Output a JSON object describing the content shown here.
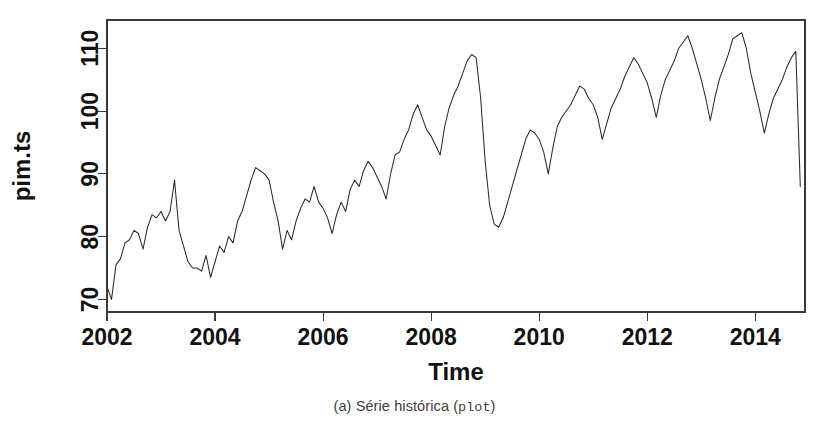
{
  "figure": {
    "caption_prefix": "(a) Série histórica (",
    "caption_code": "plot",
    "caption_suffix": ")",
    "caption_full": "(a) Série histórica (plot)",
    "line_color": "#2b2b2b",
    "axis_color": "#3a3a3a",
    "background_color": "#ffffff"
  },
  "chart_data": {
    "type": "line",
    "title": "",
    "subtitle": "",
    "xlabel": "Time",
    "ylabel": "pim.ts",
    "xlim": [
      2002.0,
      2014.92
    ],
    "ylim": [
      68.0,
      114.5
    ],
    "xticks": [
      2002,
      2004,
      2006,
      2008,
      2010,
      2012,
      2014
    ],
    "xtick_labels": [
      "2002",
      "2004",
      "2006",
      "2008",
      "2010",
      "2012",
      "2014"
    ],
    "yticks": [
      70,
      80,
      90,
      100,
      110
    ],
    "ytick_labels": [
      "70",
      "80",
      "90",
      "100",
      "110"
    ],
    "grid": false,
    "legend": false,
    "legend_position": "none",
    "box": true,
    "frequency": "monthly",
    "start": "2002-01",
    "end": "2014-11",
    "series": [
      {
        "name": "pim.ts",
        "color": "#2b2b2b",
        "x": [
          2002.0,
          2002.083,
          2002.167,
          2002.25,
          2002.333,
          2002.417,
          2002.5,
          2002.583,
          2002.667,
          2002.75,
          2002.833,
          2002.917,
          2003.0,
          2003.083,
          2003.167,
          2003.25,
          2003.333,
          2003.417,
          2003.5,
          2003.583,
          2003.667,
          2003.75,
          2003.833,
          2003.917,
          2004.0,
          2004.083,
          2004.167,
          2004.25,
          2004.333,
          2004.417,
          2004.5,
          2004.583,
          2004.667,
          2004.75,
          2004.833,
          2004.917,
          2005.0,
          2005.083,
          2005.167,
          2005.25,
          2005.333,
          2005.417,
          2005.5,
          2005.583,
          2005.667,
          2005.75,
          2005.833,
          2005.917,
          2006.0,
          2006.083,
          2006.167,
          2006.25,
          2006.333,
          2006.417,
          2006.5,
          2006.583,
          2006.667,
          2006.75,
          2006.833,
          2006.917,
          2007.0,
          2007.083,
          2007.167,
          2007.25,
          2007.333,
          2007.417,
          2007.5,
          2007.583,
          2007.667,
          2007.75,
          2007.833,
          2007.917,
          2008.0,
          2008.083,
          2008.167,
          2008.25,
          2008.333,
          2008.417,
          2008.5,
          2008.583,
          2008.667,
          2008.75,
          2008.833,
          2008.917,
          2009.0,
          2009.083,
          2009.167,
          2009.25,
          2009.333,
          2009.417,
          2009.5,
          2009.583,
          2009.667,
          2009.75,
          2009.833,
          2009.917,
          2010.0,
          2010.083,
          2010.167,
          2010.25,
          2010.333,
          2010.417,
          2010.5,
          2010.583,
          2010.667,
          2010.75,
          2010.833,
          2010.917,
          2011.0,
          2011.083,
          2011.167,
          2011.25,
          2011.333,
          2011.417,
          2011.5,
          2011.583,
          2011.667,
          2011.75,
          2011.833,
          2011.917,
          2012.0,
          2012.083,
          2012.167,
          2012.25,
          2012.333,
          2012.417,
          2012.5,
          2012.583,
          2012.667,
          2012.75,
          2012.833,
          2012.917,
          2013.0,
          2013.083,
          2013.167,
          2013.25,
          2013.333,
          2013.417,
          2013.5,
          2013.583,
          2013.667,
          2013.75,
          2013.833,
          2013.917,
          2014.0,
          2014.083,
          2014.167,
          2014.25,
          2014.333,
          2014.417,
          2014.5,
          2014.583,
          2014.667,
          2014.75,
          2014.833
        ],
        "values": [
          72.0,
          70.0,
          75.5,
          76.5,
          79.0,
          79.5,
          81.0,
          80.5,
          78.0,
          81.5,
          83.5,
          83.0,
          84.0,
          82.5,
          84.0,
          89.0,
          81.0,
          78.5,
          76.0,
          75.0,
          75.0,
          74.5,
          77.0,
          73.5,
          76.0,
          78.5,
          77.5,
          80.0,
          79.0,
          82.5,
          84.0,
          86.5,
          89.0,
          91.0,
          90.5,
          90.0,
          89.0,
          85.5,
          82.5,
          78.0,
          81.0,
          79.5,
          82.5,
          84.5,
          86.0,
          85.5,
          88.0,
          85.5,
          84.5,
          83.0,
          80.5,
          83.5,
          85.5,
          84.0,
          87.5,
          89.0,
          88.0,
          90.5,
          92.0,
          91.0,
          89.5,
          88.0,
          86.0,
          90.0,
          93.0,
          93.5,
          95.5,
          97.0,
          99.5,
          101.0,
          99.0,
          97.0,
          96.0,
          94.5,
          93.0,
          97.5,
          100.5,
          102.5,
          104.0,
          106.0,
          108.0,
          109.0,
          108.5,
          102.0,
          92.0,
          85.0,
          82.0,
          81.5,
          83.0,
          85.5,
          88.0,
          90.5,
          93.0,
          95.5,
          97.0,
          96.5,
          95.5,
          93.5,
          90.0,
          94.0,
          97.5,
          99.0,
          100.0,
          101.0,
          102.5,
          104.0,
          103.5,
          102.0,
          101.0,
          99.0,
          95.5,
          98.0,
          100.5,
          102.0,
          103.5,
          105.5,
          107.0,
          108.5,
          107.5,
          106.0,
          104.5,
          102.0,
          99.0,
          102.5,
          105.0,
          106.5,
          108.0,
          110.0,
          111.0,
          112.0,
          110.0,
          107.5,
          105.0,
          102.0,
          98.5,
          102.0,
          105.0,
          107.0,
          109.0,
          111.5,
          112.0,
          112.5,
          110.0,
          106.0,
          103.0,
          100.0,
          96.5,
          99.5,
          102.0,
          103.5,
          105.0,
          107.0,
          108.5,
          109.5,
          88.0
        ]
      }
    ]
  }
}
